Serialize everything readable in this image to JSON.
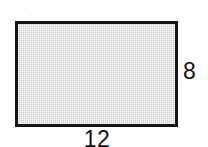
{
  "figure": {
    "kind": "geometry-diagram",
    "shape": "rectangle",
    "background_color": "#ffffff",
    "outline_color": "#141414",
    "fill_color": "#d4d4d4",
    "label_color": "#121212"
  },
  "labels": {
    "height": "8",
    "width": "12"
  },
  "chart_data": {
    "type": "diagram",
    "shape": "rectangle",
    "title": "",
    "annotations": [
      {
        "name": "width",
        "value": 12,
        "text": "12",
        "position": "bottom"
      },
      {
        "name": "height",
        "value": 8,
        "text": "8",
        "position": "right"
      }
    ],
    "derived": {
      "area": 96,
      "perimeter": 40
    }
  }
}
